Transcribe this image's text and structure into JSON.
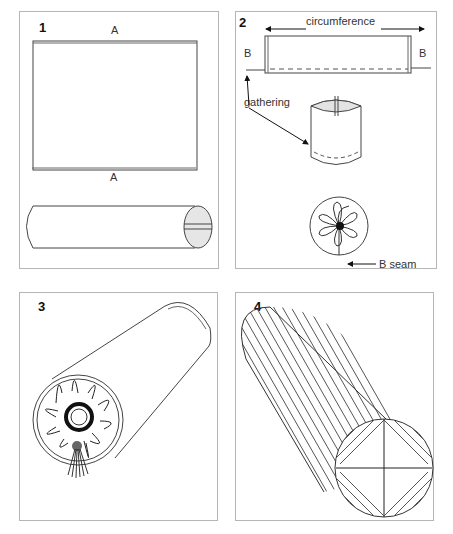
{
  "panels": [
    {
      "number": "1",
      "labels": {
        "top_edge": "A",
        "bottom_edge": "A"
      }
    },
    {
      "number": "2",
      "labels": {
        "circumference": "circumference",
        "left_edge": "B",
        "right_edge": "B",
        "gathering": "gathering",
        "seam": "B seam"
      }
    },
    {
      "number": "3"
    },
    {
      "number": "4"
    }
  ]
}
